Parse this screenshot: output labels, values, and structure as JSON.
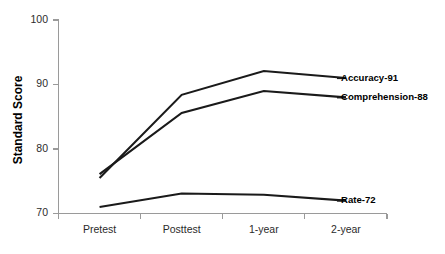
{
  "chart_data": {
    "type": "line",
    "title": "",
    "xlabel": "",
    "ylabel": "Standard Score",
    "categories": [
      "Pretest",
      "Posttest",
      "1-year",
      "2-year"
    ],
    "ylim": [
      70,
      100
    ],
    "yticks": [
      70,
      80,
      90,
      100
    ],
    "ytick_labels": [
      "70",
      "80",
      "90",
      "100"
    ],
    "grid": false,
    "legend_position": "right-inline-end-of-line",
    "series": [
      {
        "name": "Accuracy",
        "end_label": "Accuracy-91",
        "values": [
          75.5,
          88.4,
          92.1,
          91.0
        ],
        "color": "#1a1a1a"
      },
      {
        "name": "Comprehension",
        "end_label": "Comprehension-88",
        "values": [
          76.1,
          85.6,
          89.0,
          88.0
        ],
        "color": "#1a1a1a"
      },
      {
        "name": "Rate",
        "end_label": "Rate-72",
        "values": [
          71.0,
          73.1,
          72.9,
          72.0
        ],
        "color": "#1a1a1a"
      }
    ],
    "annotations": [
      "Accuracy-91",
      "Comprehension-88",
      "Rate-72"
    ]
  },
  "axes": {
    "y_title": "Standard Score"
  }
}
